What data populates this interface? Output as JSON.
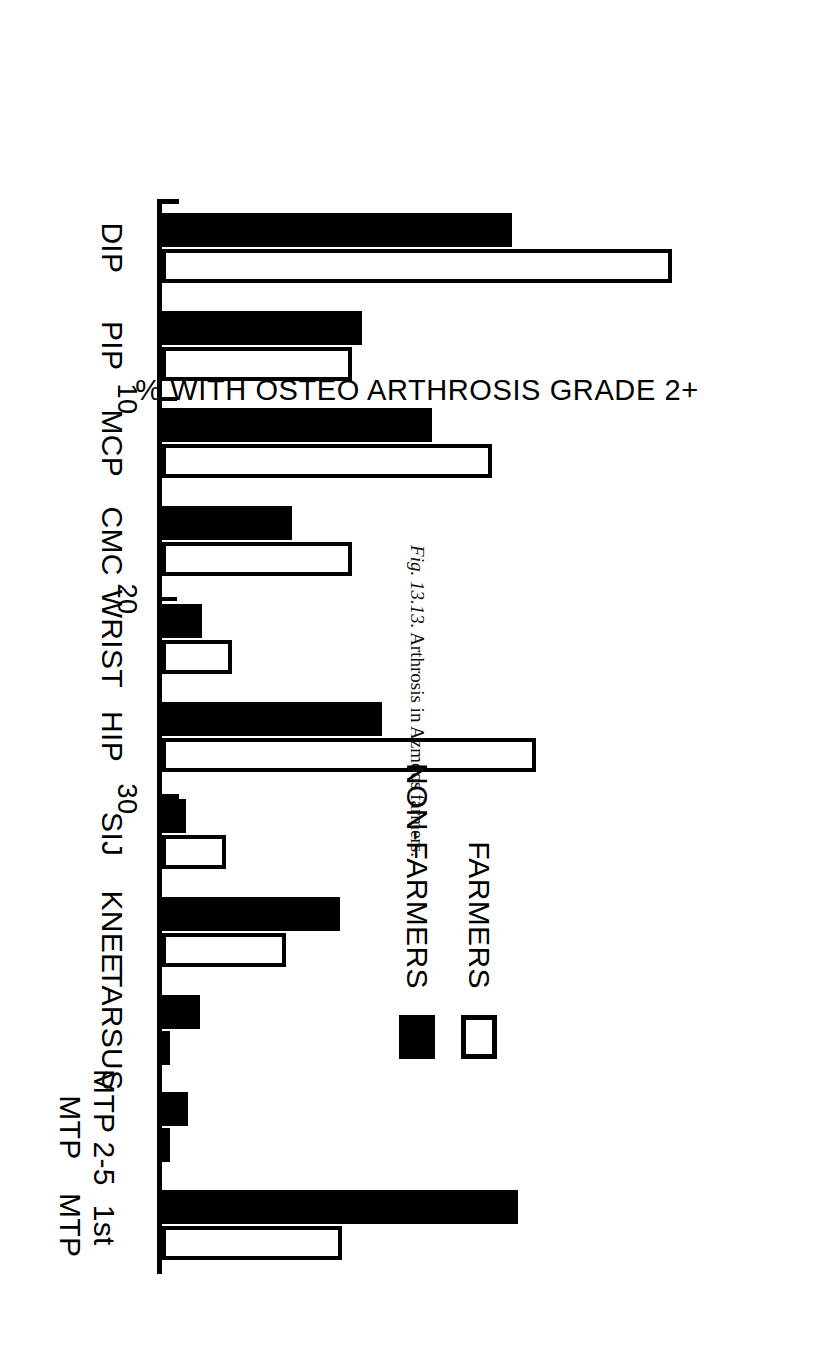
{
  "caption": {
    "figure_number": "Fig. 13.13.",
    "text": "Arthrosis in Azmoos farmers."
  },
  "legend": {
    "position": "top-left",
    "entries": [
      {
        "label": "FARMERS",
        "swatch": "open-square-icon",
        "color": "#ffffff"
      },
      {
        "label": "NON-FARMERS",
        "swatch": "filled-square-icon",
        "color": "#000000"
      }
    ]
  },
  "chart_data": {
    "type": "bar",
    "orientation": "vertical-rotated-90ccw",
    "title": "",
    "subtitle": "",
    "xlabel": "",
    "ylabel": "% WITH OSTEO ARTHROSIS GRADE 2+",
    "ylim": [
      0,
      30
    ],
    "yticks": [
      0,
      10,
      20,
      30
    ],
    "ytick_labels": [
      "",
      "10",
      "20",
      "30"
    ],
    "grid": false,
    "legend_position": "top-left",
    "categories": [
      "DIP",
      "PIP",
      "MCP",
      "CMC",
      "WRIST",
      "HIP",
      "SIJ",
      "KNEE",
      "TARSUS",
      "MTP 2-5",
      "1st MTP"
    ],
    "category_labels_multiline": {
      "MTP 2-5": [
        "MTP 2-5",
        "MTP"
      ],
      "1st MTP": [
        "1st",
        "MTP"
      ]
    },
    "series": [
      {
        "name": "FARMERS",
        "color": "#ffffff",
        "edge_color": "#000000",
        "values": [
          25.5,
          9.5,
          16.5,
          9.5,
          3.5,
          18.7,
          3.2,
          6.2,
          0,
          0,
          9.0
        ]
      },
      {
        "name": "NON-FARMERS",
        "color": "#000000",
        "edge_color": "#000000",
        "values": [
          17.5,
          10.0,
          13.5,
          6.5,
          2.0,
          11.0,
          1.2,
          8.9,
          1.9,
          1.3,
          17.8
        ]
      }
    ]
  }
}
